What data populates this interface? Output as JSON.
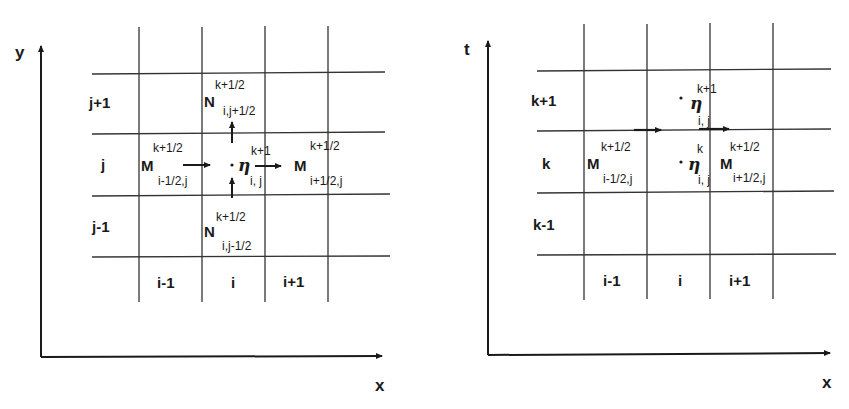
{
  "left_diagram": {
    "axes": {
      "x_label": "x",
      "y_label": "y"
    },
    "row_labels": [
      "j+1",
      "j",
      "j-1"
    ],
    "col_labels": [
      "i-1",
      "i",
      "i+1"
    ],
    "nodes": {
      "n_top": {
        "symbol": "N",
        "sup": "k+1/2",
        "sub": "i,j+1/2"
      },
      "n_bottom": {
        "symbol": "N",
        "sup": "k+1/2",
        "sub": "i,j-1/2"
      },
      "m_left": {
        "symbol": "M",
        "sup": "k+1/2",
        "sub": "i-1/2,j"
      },
      "m_right": {
        "symbol": "M",
        "sup": "k+1/2",
        "sub": "i+1/2,j"
      },
      "eta_center": {
        "symbol": "η",
        "sup": "k+1",
        "sub": "i, j"
      }
    }
  },
  "right_diagram": {
    "axes": {
      "x_label": "x",
      "y_label": "t"
    },
    "row_labels": [
      "k+1",
      "k",
      "k-1"
    ],
    "col_labels": [
      "i-1",
      "i",
      "i+1"
    ],
    "nodes": {
      "eta_upper": {
        "symbol": "η",
        "sup": "k+1",
        "sub": "i, j"
      },
      "eta_lower": {
        "symbol": "η",
        "sup": "k",
        "sub": "i, j"
      },
      "m_left": {
        "symbol": "M",
        "sup": "k+1/2",
        "sub": "i-1/2,j"
      },
      "m_right": {
        "symbol": "M",
        "sup": "k+1/2",
        "sub": "i+1/2,j"
      }
    }
  }
}
